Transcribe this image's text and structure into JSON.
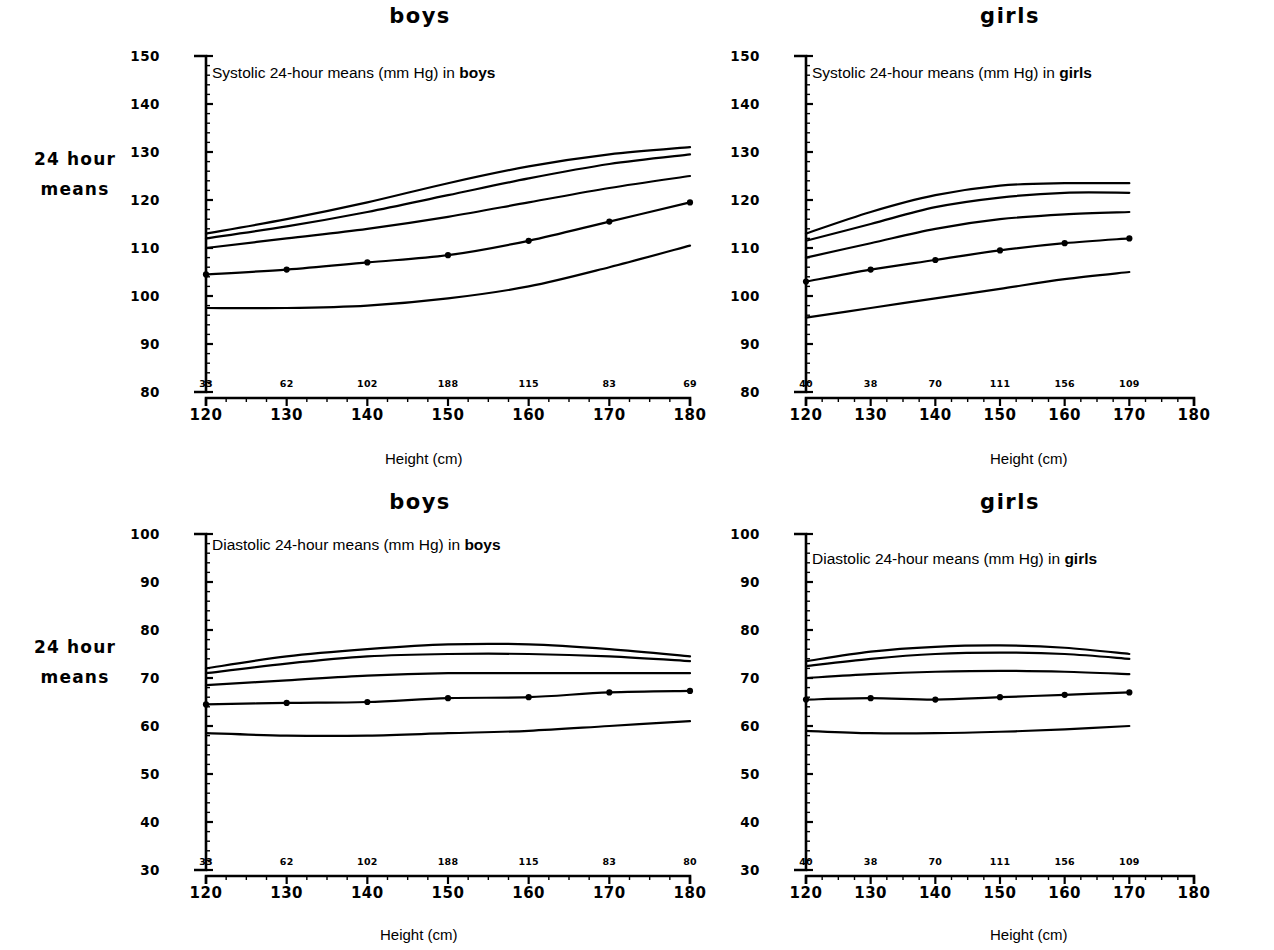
{
  "figure": {
    "row_labels": [
      {
        "line1": "24  hour",
        "line2": "means"
      },
      {
        "line1": "24  hour",
        "line2": "means"
      }
    ],
    "column_headers": [
      "boys",
      "girls",
      "boys",
      "girls"
    ],
    "axis_caption_x": "Height (cm)",
    "axis_caption_x_alt": "Height  (cm)",
    "ink_color": "#000000",
    "background": "#ffffff"
  },
  "chart_data": [
    {
      "id": "systolic-boys",
      "type": "line",
      "title": "Systolic 24-hour means (mm Hg) in boys",
      "title_plain": "Systolic 24-hour means (mm Hg) in ",
      "title_bold": "boys",
      "panel_header": "boys",
      "xlabel": "Height (cm)",
      "ylabel": "",
      "xlim": [
        120,
        180
      ],
      "ylim": [
        80,
        150
      ],
      "xticks": [
        120,
        130,
        140,
        150,
        160,
        170,
        180
      ],
      "yticks": [
        80,
        90,
        100,
        110,
        120,
        130,
        140,
        150
      ],
      "grid": false,
      "legend": "none",
      "sample_counts": {
        "at": [
          120,
          130,
          140,
          150,
          160,
          170,
          180
        ],
        "values": [
          33,
          62,
          102,
          188,
          115,
          83,
          69
        ]
      },
      "x": [
        120,
        130,
        140,
        150,
        160,
        170,
        180
      ],
      "series": [
        {
          "name": "95th percentile",
          "values": [
            113.0,
            116.0,
            119.5,
            123.5,
            127.0,
            129.5,
            131.0
          ]
        },
        {
          "name": "90th percentile",
          "values": [
            112.0,
            114.5,
            117.5,
            121.0,
            124.5,
            127.5,
            129.5
          ]
        },
        {
          "name": "75th percentile",
          "values": [
            110.0,
            112.0,
            114.0,
            116.5,
            119.5,
            122.5,
            125.0
          ]
        },
        {
          "name": "50th percentile",
          "values": [
            104.5,
            105.5,
            107.0,
            108.5,
            111.5,
            115.5,
            119.5
          ]
        },
        {
          "name": "5th percentile",
          "values": [
            97.5,
            97.5,
            98.0,
            99.5,
            102.0,
            106.0,
            110.5
          ]
        }
      ],
      "observed_points": {
        "series": "50th percentile",
        "x": [
          120,
          130,
          140,
          150,
          160,
          170,
          180
        ],
        "y": [
          104.5,
          105.5,
          107.0,
          108.5,
          111.5,
          115.5,
          119.5
        ]
      }
    },
    {
      "id": "systolic-girls",
      "type": "line",
      "title": "Systolic 24-hour means (mm Hg) in girls",
      "title_plain": "Systolic 24-hour means (mm Hg) in ",
      "title_bold": "girls",
      "panel_header": "girls",
      "xlabel": "Height (cm)",
      "ylabel": "",
      "xlim": [
        120,
        180
      ],
      "ylim": [
        80,
        150
      ],
      "xticks": [
        120,
        130,
        140,
        150,
        160,
        170,
        180
      ],
      "yticks": [
        80,
        90,
        100,
        110,
        120,
        130,
        140,
        150
      ],
      "grid": false,
      "legend": "none",
      "sample_counts": {
        "at": [
          120,
          130,
          140,
          150,
          160,
          170
        ],
        "values": [
          40,
          38,
          70,
          111,
          156,
          109
        ]
      },
      "x": [
        120,
        130,
        140,
        150,
        160,
        170
      ],
      "series": [
        {
          "name": "95th percentile",
          "values": [
            113.0,
            117.5,
            121.0,
            123.0,
            123.5,
            123.5
          ]
        },
        {
          "name": "90th percentile",
          "values": [
            111.5,
            115.0,
            118.5,
            120.5,
            121.5,
            121.5
          ]
        },
        {
          "name": "75th percentile",
          "values": [
            108.0,
            111.0,
            114.0,
            116.0,
            117.0,
            117.5
          ]
        },
        {
          "name": "50th percentile",
          "values": [
            103.0,
            105.5,
            107.5,
            109.5,
            111.0,
            112.0
          ]
        },
        {
          "name": "5th percentile",
          "values": [
            95.5,
            97.5,
            99.5,
            101.5,
            103.5,
            105.0
          ]
        }
      ],
      "observed_points": {
        "series": "50th percentile",
        "x": [
          120,
          130,
          140,
          150,
          160,
          170
        ],
        "y": [
          103.0,
          105.5,
          107.5,
          109.5,
          111.0,
          112.0
        ]
      }
    },
    {
      "id": "diastolic-boys",
      "type": "line",
      "title": "Diastolic 24-hour means (mm Hg) in boys",
      "title_plain": "Diastolic 24-hour means (mm Hg) in ",
      "title_bold": "boys",
      "panel_header": "boys",
      "xlabel": "Height  (cm)",
      "ylabel": "",
      "xlim": [
        120,
        180
      ],
      "ylim": [
        30,
        100
      ],
      "xticks": [
        120,
        130,
        140,
        150,
        160,
        170,
        180
      ],
      "yticks": [
        30,
        40,
        50,
        60,
        70,
        80,
        90,
        100
      ],
      "grid": false,
      "legend": "none",
      "sample_counts": {
        "at": [
          120,
          130,
          140,
          150,
          160,
          170,
          180
        ],
        "values": [
          33,
          62,
          102,
          188,
          115,
          83,
          80
        ]
      },
      "x": [
        120,
        130,
        140,
        150,
        160,
        170,
        180
      ],
      "series": [
        {
          "name": "95th percentile",
          "values": [
            72.0,
            74.5,
            76.0,
            77.0,
            77.0,
            76.0,
            74.5
          ]
        },
        {
          "name": "90th percentile",
          "values": [
            71.0,
            73.0,
            74.5,
            75.0,
            75.0,
            74.5,
            73.5
          ]
        },
        {
          "name": "75th percentile",
          "values": [
            68.5,
            69.5,
            70.5,
            71.0,
            71.0,
            71.0,
            71.0
          ]
        },
        {
          "name": "50th percentile",
          "values": [
            64.5,
            64.8,
            65.0,
            65.8,
            66.0,
            67.0,
            67.3
          ]
        },
        {
          "name": "5th percentile",
          "values": [
            58.5,
            58.0,
            58.0,
            58.5,
            59.0,
            60.0,
            61.0
          ]
        }
      ],
      "observed_points": {
        "series": "50th percentile",
        "x": [
          120,
          130,
          140,
          150,
          160,
          170,
          180
        ],
        "y": [
          64.5,
          64.8,
          65.0,
          65.8,
          66.0,
          67.0,
          67.3
        ]
      }
    },
    {
      "id": "diastolic-girls",
      "type": "line",
      "title": "Diastolic 24-hour means (mm Hg) in girls",
      "title_plain": "Diastolic 24-hour means (mm Hg) in ",
      "title_bold": "girls",
      "panel_header": "girls",
      "xlabel": "Height (cm)",
      "ylabel": "",
      "xlim": [
        120,
        180
      ],
      "ylim": [
        30,
        100
      ],
      "xticks": [
        120,
        130,
        140,
        150,
        160,
        170,
        180
      ],
      "yticks": [
        30,
        40,
        50,
        60,
        70,
        80,
        90,
        100
      ],
      "grid": false,
      "legend": "none",
      "sample_counts": {
        "at": [
          120,
          130,
          140,
          150,
          160,
          170
        ],
        "values": [
          40,
          38,
          70,
          111,
          156,
          109
        ]
      },
      "x": [
        120,
        130,
        140,
        150,
        160,
        170
      ],
      "series": [
        {
          "name": "95th percentile",
          "values": [
            73.5,
            75.5,
            76.5,
            76.8,
            76.3,
            75.0
          ]
        },
        {
          "name": "90th percentile",
          "values": [
            72.5,
            74.0,
            75.0,
            75.3,
            75.0,
            74.0
          ]
        },
        {
          "name": "75th percentile",
          "values": [
            70.0,
            70.8,
            71.3,
            71.5,
            71.3,
            70.8
          ]
        },
        {
          "name": "50th percentile",
          "values": [
            65.5,
            65.8,
            65.5,
            66.0,
            66.5,
            67.0
          ]
        },
        {
          "name": "5th percentile",
          "values": [
            59.0,
            58.5,
            58.5,
            58.8,
            59.3,
            60.0
          ]
        }
      ],
      "observed_points": {
        "series": "50th percentile",
        "x": [
          120,
          130,
          140,
          150,
          160,
          170
        ],
        "y": [
          65.5,
          65.8,
          65.5,
          66.0,
          66.5,
          67.0
        ]
      }
    }
  ]
}
